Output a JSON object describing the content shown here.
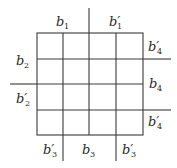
{
  "diagram": {
    "type": "grid-with-boundary-labels",
    "grid": {
      "rows": 4,
      "cols": 4
    },
    "labels": {
      "top_left": {
        "base": "b",
        "sub": "1",
        "prime": ""
      },
      "top_right": {
        "base": "b",
        "sub": "1",
        "prime": "′"
      },
      "left_upper": {
        "base": "b",
        "sub": "2",
        "prime": ""
      },
      "left_lower": {
        "base": "b",
        "sub": "2",
        "prime": "′"
      },
      "right_top": {
        "base": "b",
        "sub": "4",
        "prime": "′"
      },
      "right_middle": {
        "base": "b",
        "sub": "4",
        "prime": ""
      },
      "right_bottom": {
        "base": "b",
        "sub": "4",
        "prime": "′"
      },
      "bottom_left": {
        "base": "b",
        "sub": "3",
        "prime": "′"
      },
      "bottom_middle": {
        "base": "b",
        "sub": "3",
        "prime": ""
      },
      "bottom_right": {
        "base": "b",
        "sub": "3",
        "prime": "′"
      }
    }
  }
}
